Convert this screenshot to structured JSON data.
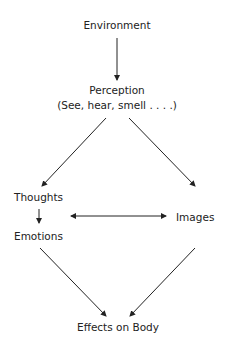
{
  "diagram": {
    "nodes": {
      "environment": "Environment",
      "perception": "Perception",
      "perception_sub": "(See, hear, smell . . . .)",
      "thoughts": "Thoughts",
      "emotions": "Emotions",
      "images": "Images",
      "effects": "Effects on Body"
    },
    "edges": [
      {
        "from": "Environment",
        "to": "Perception"
      },
      {
        "from": "Perception",
        "to": "Thoughts"
      },
      {
        "from": "Perception",
        "to": "Images"
      },
      {
        "from": "Thoughts",
        "to": "Emotions"
      },
      {
        "from": "Thoughts/Emotions",
        "to": "Images",
        "bidirectional": true
      },
      {
        "from": "Emotions",
        "to": "Effects on Body"
      },
      {
        "from": "Images",
        "to": "Effects on Body"
      }
    ]
  }
}
